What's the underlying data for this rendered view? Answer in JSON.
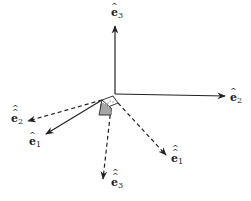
{
  "diagram": {
    "type": "coordinate-frame-rotation",
    "origin": {
      "x": 115,
      "y": 94
    },
    "colors": {
      "stroke": "#222222",
      "background": "#ffffff"
    },
    "fixed_axes": [
      {
        "id": "e3",
        "label": "e",
        "subscript": "3",
        "hats": 1,
        "style": "solid",
        "tip": {
          "x": 115,
          "y": 25
        },
        "label_pos": {
          "x": 111,
          "y": 16
        }
      },
      {
        "id": "e2",
        "label": "e",
        "subscript": "2",
        "hats": 1,
        "style": "solid",
        "tip": {
          "x": 226,
          "y": 96
        },
        "label_pos": {
          "x": 229,
          "y": 101
        }
      },
      {
        "id": "e1",
        "label": "e",
        "subscript": "1",
        "hats": 1,
        "style": "solid",
        "start": {
          "x": 102,
          "y": 100
        },
        "tip": {
          "x": 45,
          "y": 135
        },
        "label_pos": {
          "x": 28,
          "y": 145
        }
      }
    ],
    "rotated_axes": [
      {
        "id": "ee2",
        "label": "e",
        "subscript": "2",
        "hats": 2,
        "style": "dashed",
        "start": {
          "x": 102,
          "y": 100
        },
        "tip": {
          "x": 27,
          "y": 121
        },
        "label_pos": {
          "x": 11,
          "y": 122
        }
      },
      {
        "id": "ee1",
        "label": "e",
        "subscript": "1",
        "hats": 2,
        "style": "dashed",
        "start": {
          "x": 118,
          "y": 103
        },
        "tip": {
          "x": 167,
          "y": 156
        },
        "label_pos": {
          "x": 172,
          "y": 162
        }
      },
      {
        "id": "ee3",
        "label": "e",
        "subscript": "3",
        "hats": 2,
        "style": "dashed",
        "start": {
          "x": 111,
          "y": 108
        },
        "tip": {
          "x": 103,
          "y": 180
        },
        "label_pos": {
          "x": 111,
          "y": 186
        }
      }
    ],
    "labels": {
      "e3": "ê₃",
      "e2": "ê₂",
      "e1": "ê₁",
      "ee1": "ê̂₁",
      "ee2": "ê̂₂",
      "ee3": "ê̂₃"
    }
  }
}
